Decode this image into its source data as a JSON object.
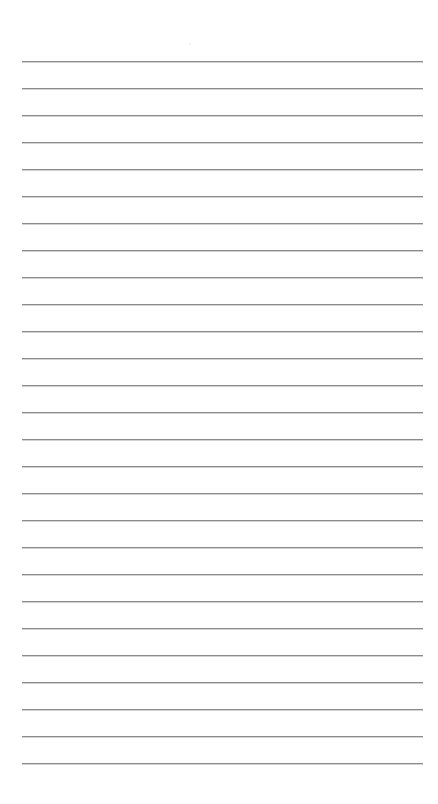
{
  "page": {
    "type": "lined-paper",
    "background_color": "#ffffff",
    "line_color": "#8c8c8c",
    "line_count": 27,
    "first_line_y": 61,
    "line_spacing": 27,
    "line_left": 22,
    "line_right": 423
  }
}
